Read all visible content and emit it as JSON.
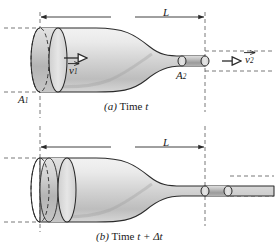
{
  "figure": {
    "panels": [
      {
        "id": "a",
        "caption_prefix": "(a)",
        "caption_text": "Time",
        "caption_var": "t",
        "dimension_label": "L",
        "labels": {
          "area_in": "A",
          "area_in_sub": "1",
          "area_out": "A",
          "area_out_sub": "2",
          "velocity_in": "v",
          "velocity_in_sub": "1",
          "velocity_out": "v",
          "velocity_out_sub": "2"
        }
      },
      {
        "id": "b",
        "caption_prefix": "(b)",
        "caption_text": "Time",
        "caption_var": "t + Δt",
        "dimension_label": "L"
      }
    ]
  },
  "colors": {
    "tube_light": "#e3e3e3",
    "tube_mid": "#c9c9c9",
    "tube_dark": "#a8a8a8",
    "outline": "#2b2b2b",
    "dashed": "#555555",
    "text": "#1a1a1a",
    "background": "#ffffff"
  }
}
